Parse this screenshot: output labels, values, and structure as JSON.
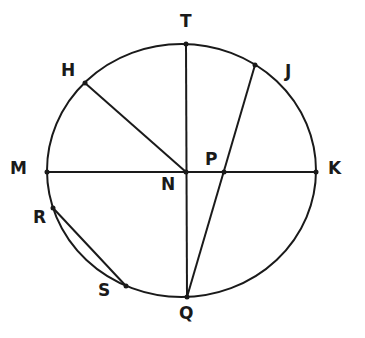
{
  "diagram": {
    "type": "circle-geometry",
    "stroke_color": "#1a1a1a",
    "background": "#ffffff",
    "circle": {
      "cx": 181.5,
      "cy": 170.5,
      "rx": 134.5,
      "ry": 126.5
    },
    "points": {
      "T": {
        "x": 186,
        "y": 44,
        "label": "T",
        "lx": 180,
        "ly": 27
      },
      "H": {
        "x": 85,
        "y": 83,
        "label": "H",
        "lx": 61,
        "ly": 76
      },
      "J": {
        "x": 255,
        "y": 65,
        "label": "J",
        "lx": 285,
        "ly": 77
      },
      "M": {
        "x": 47,
        "y": 172,
        "label": "M",
        "lx": 10,
        "ly": 174
      },
      "N": {
        "x": 186,
        "y": 172,
        "label": "N",
        "lx": 161,
        "ly": 190
      },
      "P": {
        "x": 224,
        "y": 172,
        "label": "P",
        "lx": 205,
        "ly": 165
      },
      "K": {
        "x": 316,
        "y": 172,
        "label": "K",
        "lx": 328,
        "ly": 174
      },
      "R": {
        "x": 53,
        "y": 208,
        "label": "R",
        "lx": 33,
        "ly": 223
      },
      "S": {
        "x": 126,
        "y": 286,
        "label": "S",
        "lx": 98,
        "ly": 296
      },
      "Q": {
        "x": 187,
        "y": 297,
        "label": "Q",
        "lx": 179,
        "ly": 319
      }
    },
    "segments": [
      {
        "name": "MK",
        "from": "M",
        "to": "K"
      },
      {
        "name": "TQ",
        "from": "T",
        "to": "Q"
      },
      {
        "name": "HN",
        "from": "H",
        "to": "N"
      },
      {
        "name": "JQ",
        "from": "J",
        "to": "Q"
      },
      {
        "name": "RS",
        "from": "R",
        "to": "S"
      }
    ]
  }
}
